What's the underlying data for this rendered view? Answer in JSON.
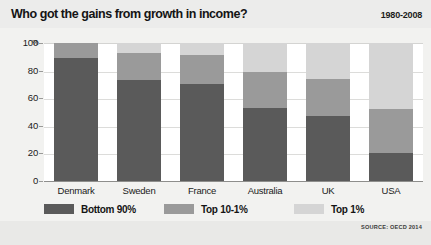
{
  "header": {
    "title": "Who got the gains from growth in income?",
    "date_range": "1980-2008"
  },
  "footer": {
    "source": "SOURCE: OECD 2014"
  },
  "axis": {
    "percent_symbol": "%",
    "ticks": [
      "100",
      "80",
      "60",
      "40",
      "20",
      "0"
    ]
  },
  "legend": {
    "items": [
      {
        "label": "Bottom 90%",
        "color": "#5a5a5a"
      },
      {
        "label": "Top 10-1%",
        "color": "#9a9a9a"
      },
      {
        "label": "Top 1%",
        "color": "#d5d5d5"
      }
    ]
  },
  "colors": {
    "bottom90": "#5a5a5a",
    "top10to1": "#9a9a9a",
    "top1": "#d5d5d5",
    "background": "#f2f2f0",
    "plot_background": "#ffffff",
    "gridline": "#dcdcda"
  },
  "chart_data": {
    "type": "bar",
    "title": "Who got the gains from growth in income?",
    "subtitle": "1980-2008",
    "xlabel": "",
    "ylabel": "%",
    "ylim": [
      0,
      100
    ],
    "yticks": [
      0,
      20,
      40,
      60,
      80,
      100
    ],
    "grid": true,
    "stacked": true,
    "legend_position": "bottom",
    "annotation": "SOURCE: OECD 2014",
    "categories": [
      "Denmark",
      "Sweden",
      "France",
      "Australia",
      "UK",
      "USA"
    ],
    "series": [
      {
        "name": "Bottom 90%",
        "color": "#5a5a5a",
        "values": [
          89,
          73,
          70,
          53,
          47,
          20
        ]
      },
      {
        "name": "Top 10-1%",
        "color": "#9a9a9a",
        "values": [
          11,
          20,
          21,
          26,
          27,
          32
        ]
      },
      {
        "name": "Top 1%",
        "color": "#d5d5d5",
        "values": [
          0,
          7,
          9,
          21,
          26,
          48
        ]
      }
    ]
  }
}
